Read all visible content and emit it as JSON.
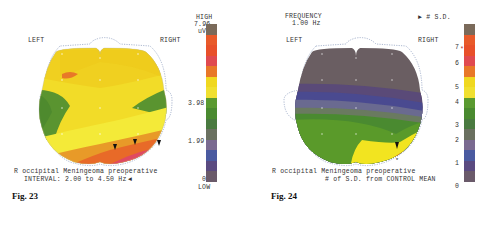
{
  "figures": [
    {
      "id": "fig23",
      "caption": "Fig. 23",
      "left_label": "LEFT",
      "right_label": "RIGHT",
      "description_line1": "R occipital Meningeoma preoperative",
      "description_line2": "INTERVAL: 2.00 to 4.50 Hz",
      "arrow_glyph": "◄",
      "scale": {
        "top_label": "HIGH",
        "max_value": "7.96",
        "unit": "uV",
        "mid_value": "3.98",
        "low_value": "1.99",
        "min_value": "0",
        "bottom_label": "LOW",
        "colors": [
          "#7a6a5a",
          "#e85a2a",
          "#e8502a",
          "#e04a50",
          "#e87828",
          "#f0d820",
          "#f0e030",
          "#5a9a30",
          "#4a8a30",
          "#4a7a40",
          "#6a7060",
          "#7a6a90",
          "#4a5aa0",
          "#5a4a80",
          "#6a5a6a"
        ]
      }
    },
    {
      "id": "fig24",
      "caption": "Fig. 24",
      "header_line1": "FREQUENCY",
      "header_line2": "1.00 Hz",
      "sd_marker": "► # S.D.",
      "left_label": "LEFT",
      "right_label": "RIGHT",
      "description_line1": "R occipital Meningeoma preoperative",
      "description_line2": "# of S.D. from CONTROL MEAN",
      "scale": {
        "ticks": [
          "7",
          "6",
          "5",
          "4",
          "3",
          "2",
          "1",
          "0"
        ],
        "marker": "*",
        "colors": [
          "#7a6a5a",
          "#e85a2a",
          "#e8502a",
          "#e04a50",
          "#e87828",
          "#f0d820",
          "#f0e030",
          "#5a9a30",
          "#4a8a30",
          "#4a7a40",
          "#6a7060",
          "#7a6a90",
          "#4a5aa0",
          "#5a4a80",
          "#6a5a6a"
        ]
      }
    }
  ]
}
